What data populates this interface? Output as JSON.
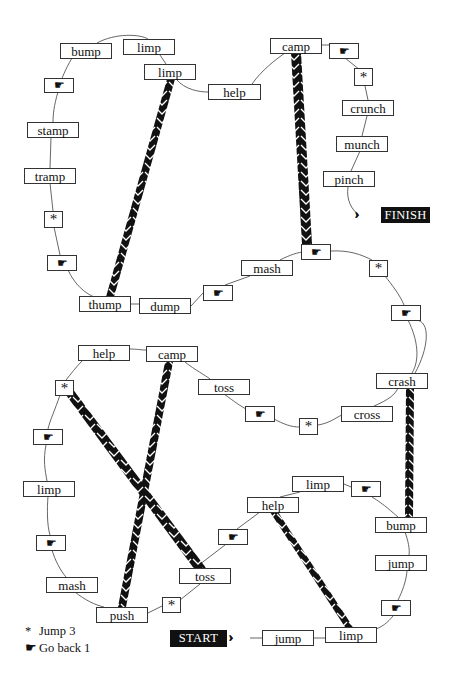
{
  "game": {
    "type": "board-game",
    "start_label": "START",
    "finish_label": "FINISH",
    "legend": [
      {
        "symbol": "*",
        "symbol_name": "asterisk",
        "text": "Jump 3"
      },
      {
        "symbol": "☛",
        "symbol_name": "pointing-hand",
        "text": "Go back 1"
      }
    ]
  },
  "squares": [
    {
      "id": "s01",
      "label": "START",
      "kind": "start"
    },
    {
      "id": "s02",
      "label": "jump",
      "kind": "word"
    },
    {
      "id": "s03",
      "label": "limp",
      "kind": "word"
    },
    {
      "id": "s04",
      "label": "☛",
      "kind": "go-back"
    },
    {
      "id": "s05",
      "label": "jump",
      "kind": "word"
    },
    {
      "id": "s06",
      "label": "bump",
      "kind": "word"
    },
    {
      "id": "s07",
      "label": "☛",
      "kind": "go-back"
    },
    {
      "id": "s08",
      "label": "limp",
      "kind": "word"
    },
    {
      "id": "s09",
      "label": "help",
      "kind": "word"
    },
    {
      "id": "s10",
      "label": "☛",
      "kind": "go-back"
    },
    {
      "id": "s11",
      "label": "toss",
      "kind": "word"
    },
    {
      "id": "s12",
      "label": "*",
      "kind": "jump"
    },
    {
      "id": "s13",
      "label": "push",
      "kind": "word"
    },
    {
      "id": "s14",
      "label": "mash",
      "kind": "word"
    },
    {
      "id": "s15",
      "label": "☛",
      "kind": "go-back"
    },
    {
      "id": "s16",
      "label": "limp",
      "kind": "word"
    },
    {
      "id": "s17",
      "label": "☛",
      "kind": "go-back"
    },
    {
      "id": "s18",
      "label": "*",
      "kind": "jump"
    },
    {
      "id": "s19",
      "label": "help",
      "kind": "word"
    },
    {
      "id": "s20",
      "label": "camp",
      "kind": "word"
    },
    {
      "id": "s21",
      "label": "toss",
      "kind": "word"
    },
    {
      "id": "s22",
      "label": "☛",
      "kind": "go-back"
    },
    {
      "id": "s23",
      "label": "*",
      "kind": "jump"
    },
    {
      "id": "s24",
      "label": "cross",
      "kind": "word"
    },
    {
      "id": "s25",
      "label": "crash",
      "kind": "word"
    },
    {
      "id": "s26",
      "label": "☛",
      "kind": "go-back"
    },
    {
      "id": "s27",
      "label": "*",
      "kind": "jump"
    },
    {
      "id": "s28",
      "label": "☛",
      "kind": "go-back"
    },
    {
      "id": "s29",
      "label": "mash",
      "kind": "word"
    },
    {
      "id": "s30",
      "label": "☛",
      "kind": "go-back"
    },
    {
      "id": "s31",
      "label": "dump",
      "kind": "word"
    },
    {
      "id": "s32",
      "label": "thump",
      "kind": "word"
    },
    {
      "id": "s33",
      "label": "☛",
      "kind": "go-back"
    },
    {
      "id": "s34",
      "label": "*",
      "kind": "jump"
    },
    {
      "id": "s35",
      "label": "tramp",
      "kind": "word"
    },
    {
      "id": "s36",
      "label": "stamp",
      "kind": "word"
    },
    {
      "id": "s37",
      "label": "☛",
      "kind": "go-back"
    },
    {
      "id": "s38",
      "label": "bump",
      "kind": "word"
    },
    {
      "id": "s39",
      "label": "limp",
      "kind": "word"
    },
    {
      "id": "s40",
      "label": "limp",
      "kind": "word"
    },
    {
      "id": "s41",
      "label": "help",
      "kind": "word"
    },
    {
      "id": "s42",
      "label": "camp",
      "kind": "word"
    },
    {
      "id": "s43",
      "label": "☛",
      "kind": "go-back"
    },
    {
      "id": "s44",
      "label": "*",
      "kind": "jump"
    },
    {
      "id": "s45",
      "label": "crunch",
      "kind": "word"
    },
    {
      "id": "s46",
      "label": "munch",
      "kind": "word"
    },
    {
      "id": "s47",
      "label": "pinch",
      "kind": "word"
    },
    {
      "id": "s48",
      "label": "FINISH",
      "kind": "finish"
    }
  ],
  "ladders": [
    {
      "from": "help (lower)",
      "to": "limp (bottom)",
      "from_id": "s09",
      "to_id": "s03"
    },
    {
      "from": "bump (lower right)",
      "to": "crash",
      "from_id": "s06",
      "to_id": "s25"
    },
    {
      "from": "push",
      "to": "camp (lower)",
      "from_id": "s13",
      "to_id": "s20"
    },
    {
      "from": "toss (lower left)",
      "to": "* (upper left)",
      "from_id": "s11",
      "to_id": "s18"
    },
    {
      "from": "☛ (mid right)",
      "to": "camp (top)",
      "from_id": "s28",
      "to_id": "s42"
    },
    {
      "from": "thump",
      "to": "limp (top)",
      "from_id": "s32",
      "to_id": "s40"
    }
  ]
}
